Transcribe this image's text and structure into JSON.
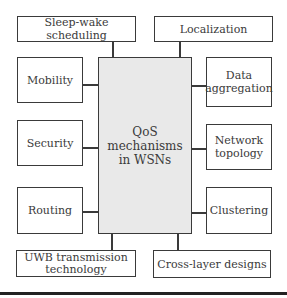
{
  "diagram": {
    "center": {
      "label": "QoS mechanisms in WSNs",
      "lines": [
        "QoS",
        "mechanisms",
        "in WSNs"
      ]
    },
    "top": [
      {
        "label": "Sleep-wake scheduling"
      },
      {
        "label": "Localization"
      }
    ],
    "left": [
      {
        "label": "Mobility"
      },
      {
        "label": "Security"
      },
      {
        "label": "Routing"
      }
    ],
    "right": [
      {
        "label": "Data aggregation",
        "lines": [
          "Data",
          "aggregation"
        ]
      },
      {
        "label": "Network topology",
        "lines": [
          "Network",
          "topology"
        ]
      },
      {
        "label": "Clustering"
      }
    ],
    "bottom": [
      {
        "label": "UWB transmission technology",
        "lines": [
          "UWB transmission",
          "technology"
        ]
      },
      {
        "label": "Cross-layer designs"
      }
    ],
    "colors": {
      "center_fill": "#e9e9e9",
      "border": "#3a3a3a"
    }
  }
}
